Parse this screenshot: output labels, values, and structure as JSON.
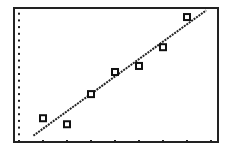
{
  "chart_data": {
    "type": "scatter",
    "title": "",
    "xlabel": "",
    "ylabel": "",
    "grid": false,
    "legend": null,
    "xlim": [
      0,
      8
    ],
    "ylim": [
      0,
      20
    ],
    "x_tick_count": 9,
    "y_tick_count": 20,
    "points": [
      {
        "x": 1,
        "y": 3.4
      },
      {
        "x": 2,
        "y": 2.5
      },
      {
        "x": 3,
        "y": 7.0
      },
      {
        "x": 4,
        "y": 10.3
      },
      {
        "x": 5,
        "y": 11.2
      },
      {
        "x": 6,
        "y": 14.0
      },
      {
        "x": 7,
        "y": 18.5
      }
    ],
    "regression_line": {
      "x1": 0.6,
      "y1": 0.8,
      "x2": 7.8,
      "y2": 19.5
    },
    "marker": "open-square",
    "colors": {
      "frame": "#222222",
      "points": "#111111",
      "line": "#222222",
      "ticks": "#222222",
      "background": "#ffffff"
    }
  },
  "layout": {
    "frame": {
      "left": 14,
      "top": 8,
      "right": 218,
      "bottom": 142
    },
    "origin_px": {
      "x": 19,
      "y": 141
    },
    "x_unit_px": 24.0,
    "y_unit_px": 6.7
  }
}
